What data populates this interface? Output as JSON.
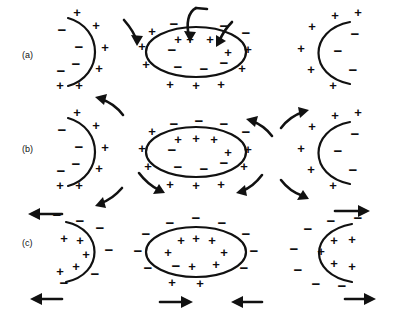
{
  "figure": {
    "background_color": "#ffffff",
    "ink_color": "#111111",
    "charge_symbols": {
      "positive": "+",
      "negative": "−"
    },
    "rows": [
      {
        "id": "row-a",
        "label": "(a)",
        "description": "Resting state: negative charges inside, positive charges outside; inward stimulus arrows at the central cell",
        "panels": [
          {
            "id": "a-left",
            "shape": "c-curve-right-facing",
            "inner_polarity": "negative",
            "outer_polarity": "positive",
            "inner_count": 4,
            "outer_count": 6,
            "arrows": []
          },
          {
            "id": "a-middle",
            "shape": "ellipse",
            "inner_polarity": "negative",
            "outer_polarity": "positive",
            "inner_count": 5,
            "outer_count": 12,
            "inner_extra_positive": 5,
            "arrows": [
              {
                "name": "stimulus-arrow-left",
                "direction": "down-right",
                "style": "curved"
              },
              {
                "name": "stimulus-arrow-top-left",
                "direction": "down",
                "style": "curved-hook"
              },
              {
                "name": "stimulus-arrow-top-right",
                "direction": "down-left",
                "style": "curved-hook"
              }
            ]
          },
          {
            "id": "a-right",
            "shape": "d-curve-left-facing",
            "inner_polarity": "negative",
            "outer_polarity": "positive",
            "inner_count": 3,
            "outer_count": 6,
            "arrows": []
          }
        ]
      },
      {
        "id": "row-b",
        "label": "(b)",
        "description": "Depolarization spreading: curved arrows radiate outward from the central cell toward the neighbouring membranes",
        "panels": [
          {
            "id": "b-left",
            "shape": "c-curve-right-facing",
            "inner_polarity": "negative",
            "outer_polarity": "positive",
            "inner_count": 4,
            "outer_count": 6,
            "arrows": [
              {
                "name": "propagation-arrow-up-left",
                "direction": "up-left",
                "style": "curved"
              },
              {
                "name": "propagation-arrow-down-left",
                "direction": "down-left",
                "style": "curved"
              }
            ]
          },
          {
            "id": "b-middle",
            "shape": "ellipse",
            "inner_polarity": "negative",
            "outer_polarity": "positive",
            "inner_count": 5,
            "outer_count": 12,
            "inner_extra_positive": 5,
            "arrows": [
              {
                "name": "propagation-arrow-up-right",
                "direction": "up-right",
                "style": "curved"
              },
              {
                "name": "propagation-arrow-down-left",
                "direction": "down-left",
                "style": "curved"
              },
              {
                "name": "propagation-arrow-down-right",
                "direction": "down-left",
                "style": "curved"
              }
            ]
          },
          {
            "id": "b-right",
            "shape": "d-curve-left-facing",
            "inner_polarity": "negative",
            "outer_polarity": "positive",
            "inner_count": 3,
            "outer_count": 6,
            "arrows": [
              {
                "name": "propagation-arrow-up-right",
                "direction": "up-right",
                "style": "curved"
              },
              {
                "name": "propagation-arrow-down-right",
                "direction": "down-right",
                "style": "curved"
              }
            ]
          }
        ]
      },
      {
        "id": "row-c",
        "label": "(c)",
        "description": "Reversed polarity: positive charges inside, negative charges outside; straight horizontal arrows show current direction",
        "panels": [
          {
            "id": "c-left",
            "shape": "c-curve-right-facing",
            "inner_polarity": "positive",
            "outer_polarity": "negative",
            "inner_count": 5,
            "outer_count": 7,
            "arrows": [
              {
                "name": "current-arrow-top-left",
                "direction": "left",
                "style": "straight"
              },
              {
                "name": "current-arrow-bottom-left",
                "direction": "left",
                "style": "straight"
              }
            ]
          },
          {
            "id": "c-middle",
            "shape": "ellipse",
            "inner_polarity": "positive",
            "outer_polarity": "negative",
            "inner_count": 8,
            "outer_count": 12,
            "arrows": [
              {
                "name": "current-arrow-bottom-left",
                "direction": "right",
                "style": "straight"
              },
              {
                "name": "current-arrow-bottom-right",
                "direction": "left",
                "style": "straight"
              }
            ]
          },
          {
            "id": "c-right",
            "shape": "d-curve-left-facing",
            "inner_polarity": "positive",
            "outer_polarity": "negative",
            "inner_count": 6,
            "outer_count": 8,
            "arrows": [
              {
                "name": "current-arrow-top-right",
                "direction": "right",
                "style": "straight"
              },
              {
                "name": "current-arrow-bottom-right",
                "direction": "right",
                "style": "straight"
              }
            ]
          }
        ]
      }
    ]
  }
}
